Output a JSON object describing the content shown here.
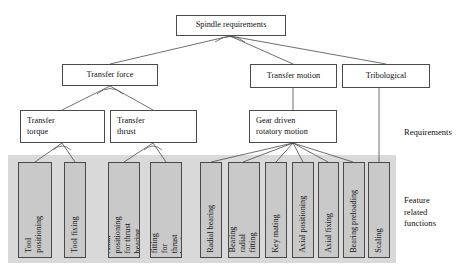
{
  "diagram": {
    "title_node": "Spindle requirements",
    "level2": [
      {
        "label": "Transfer force"
      },
      {
        "label": "Transfer motion"
      },
      {
        "label": "Tribological"
      }
    ],
    "level3": [
      {
        "label": "Transfer\ntorque"
      },
      {
        "label": "Transfer\nthrust"
      },
      {
        "label": "Gear driven\nrotatory motion"
      }
    ],
    "leaves": [
      {
        "label": "Tool\npositioning"
      },
      {
        "label": "Tool fixing"
      },
      {
        "label": "Axial positioning\nfor thrust bearing"
      },
      {
        "label": "Radial fitting for\nthrust bearing"
      },
      {
        "label": "Radial bearing"
      },
      {
        "label": "Bearing radial\nfitting"
      },
      {
        "label": "Key mating"
      },
      {
        "label": "Axial positioning"
      },
      {
        "label": "Axial fixing"
      },
      {
        "label": "Bearing preloading"
      },
      {
        "label": "Scaling"
      }
    ],
    "side_labels": {
      "requirements": "Requirements",
      "feature_related_functions": "Feature\nrelated\nfunctions"
    },
    "colors": {
      "leaf_fill": "#c9c9c9",
      "band_fill": "#d9d9d9",
      "node_fill": "#ffffff",
      "stroke": "#4a4a4a",
      "text": "#111111"
    }
  }
}
